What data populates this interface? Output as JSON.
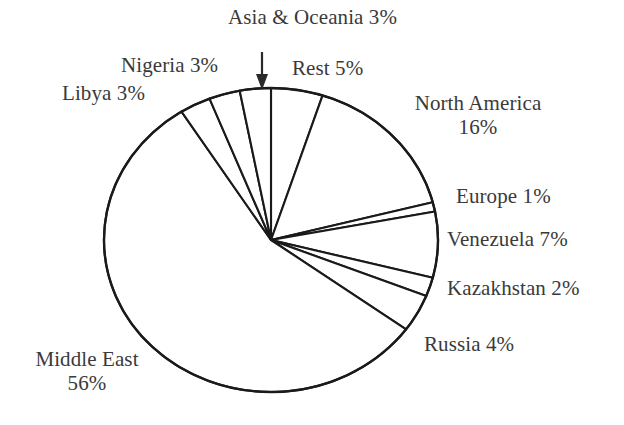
{
  "chart_data": {
    "type": "pie",
    "title": "",
    "categories": [
      "Rest",
      "North America",
      "Europe",
      "Venezuela",
      "Kazakhstan",
      "Russia",
      "Middle East",
      "Libya",
      "Nigeria",
      "Asia & Oceania"
    ],
    "values": [
      5,
      16,
      1,
      7,
      2,
      4,
      56,
      3,
      3,
      3
    ],
    "unit": "%",
    "legend_position": "outside-labels",
    "grid": false,
    "start_angle_deg": 0,
    "direction": "clockwise",
    "slice_fill": "#ffffff",
    "slice_stroke": "#1a1a1a",
    "labels": [
      {
        "name": "Asia & Oceania",
        "pct": "3%",
        "text": "Asia & Oceania 3%"
      },
      {
        "name": "Nigeria",
        "pct": "3%",
        "text": "Nigeria 3%"
      },
      {
        "name": "Libya",
        "pct": "3%",
        "text": "Libya 3%"
      },
      {
        "name": "Rest",
        "pct": "5%",
        "text": "Rest 5%"
      },
      {
        "name": "North America",
        "pct": "16%",
        "text": "North America 16%"
      },
      {
        "name": "Europe",
        "pct": "1%",
        "text": "Europe 1%"
      },
      {
        "name": "Venezuela",
        "pct": "7%",
        "text": "Venezuela 7%"
      },
      {
        "name": "Kazakhstan",
        "pct": "2%",
        "text": "Kazakhstan 2%"
      },
      {
        "name": "Russia",
        "pct": "4%",
        "text": "Russia 4%"
      },
      {
        "name": "Middle East",
        "pct": "56%",
        "text": "Middle East 56%"
      }
    ]
  },
  "labels": {
    "asia_oceania": "Asia & Oceania 3%",
    "nigeria": "Nigeria 3%",
    "libya": "Libya 3%",
    "rest": "Rest 5%",
    "north_america_name": "North America",
    "north_america_pct": "16%",
    "europe": "Europe 1%",
    "venezuela": "Venezuela 7%",
    "kazakhstan": "Kazakhstan 2%",
    "russia": "Russia 4%",
    "middle_east_name": "Middle East",
    "middle_east_pct": "56%"
  },
  "annotations": {
    "asia_arrow": "down-arrow"
  },
  "colors": {
    "stroke": "#1a1a1a",
    "text": "#3a3a3a",
    "background": "#ffffff"
  }
}
